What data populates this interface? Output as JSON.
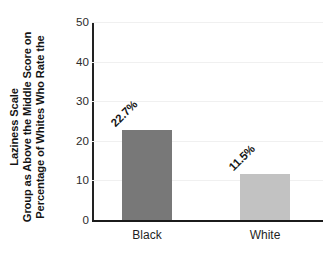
{
  "chart_data": {
    "type": "bar",
    "title": "",
    "subtitle": "",
    "xlabel": "",
    "ylabel": "Percentage of Whites Who Rate the Group as Above the Middle Score on Laziness Scale",
    "ylabel_lines": [
      "Percentage of Whites Who Rate the",
      "Group as Above the Middle Score on",
      "Laziness Scale"
    ],
    "categories": [
      "Black",
      "White"
    ],
    "values": [
      22.7,
      11.5
    ],
    "data_labels": [
      "22.7%",
      "11.5%"
    ],
    "ylim": [
      0,
      50
    ],
    "yticks": [
      0,
      10,
      20,
      30,
      40,
      50
    ],
    "ytick_labels": [
      "0",
      "10",
      "20",
      "30",
      "40",
      "50"
    ],
    "grid": true,
    "legend": false,
    "legend_position": "none",
    "bar_colors": [
      "#787878",
      "#c2c2c2"
    ],
    "background_color": "#ffffff",
    "axis_color": "#1b1b1b",
    "gridline_color": "#f0f0f0",
    "label_rotation_deg": 45
  }
}
